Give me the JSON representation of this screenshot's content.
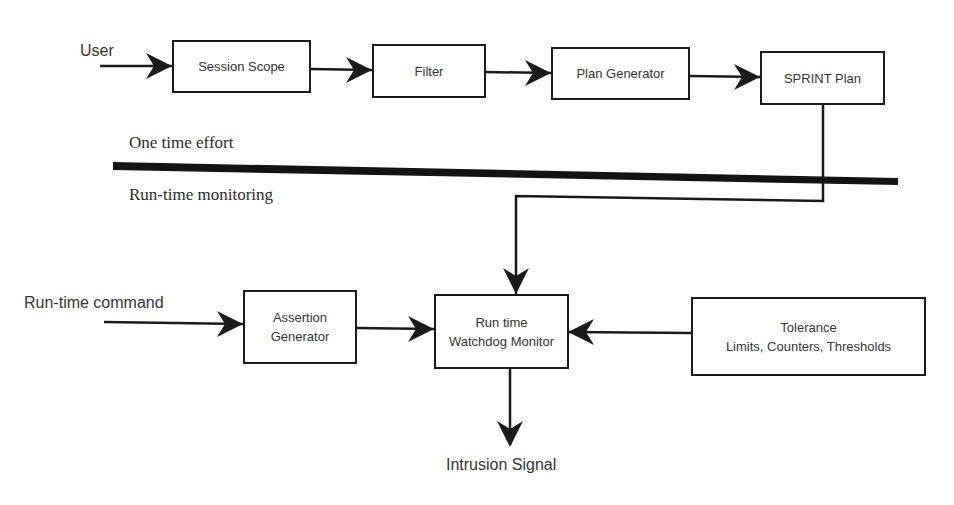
{
  "diagram": {
    "inputs": {
      "user": "User",
      "runtime_command": "Run-time command"
    },
    "phases": {
      "one_time": "One time effort",
      "runtime": "Run-time monitoring"
    },
    "nodes": {
      "session_scope": "Session Scope",
      "filter": "Filter",
      "plan_generator": "Plan Generator",
      "sprint_plan": "SPRINT Plan",
      "assertion_generator": {
        "line1": "Assertion",
        "line2": "Generator"
      },
      "watchdog": {
        "line1": "Run time",
        "line2": "Watchdog Monitor"
      },
      "tolerance": {
        "line1": "Tolerance",
        "line2": "Limits, Counters, Thresholds"
      }
    },
    "outputs": {
      "intrusion": "Intrusion Signal"
    },
    "edges": [
      [
        "User",
        "Session Scope"
      ],
      [
        "Session Scope",
        "Filter"
      ],
      [
        "Filter",
        "Plan Generator"
      ],
      [
        "Plan Generator",
        "SPRINT Plan"
      ],
      [
        "SPRINT Plan",
        "Run time Watchdog Monitor"
      ],
      [
        "Run-time command",
        "Assertion Generator"
      ],
      [
        "Assertion Generator",
        "Run time Watchdog Monitor"
      ],
      [
        "Tolerance Limits, Counters, Thresholds",
        "Run time Watchdog Monitor"
      ],
      [
        "Run time Watchdog Monitor",
        "Intrusion Signal"
      ]
    ],
    "colors": {
      "line": "#1a1a1a",
      "text": "#333333",
      "background": "#ffffff"
    }
  }
}
